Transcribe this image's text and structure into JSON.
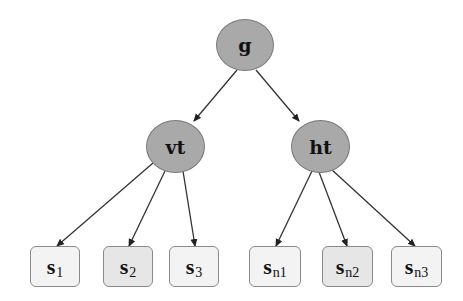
{
  "diagram": {
    "type": "tree",
    "colors": {
      "internal_node_fill": "#a9a9a9",
      "leaf_fill": "#f3f3f3",
      "leaf_alt_fill": "#e6e6e6",
      "edge": "#333333"
    },
    "root": {
      "id": "g",
      "label": "g"
    },
    "internal": [
      {
        "id": "vt",
        "label": "vt",
        "parent": "g"
      },
      {
        "id": "ht",
        "label": "ht",
        "parent": "g"
      }
    ],
    "leaves": [
      {
        "id": "s1",
        "main": "s",
        "sub": "1",
        "parent": "vt"
      },
      {
        "id": "s2",
        "main": "s",
        "sub": "2",
        "parent": "vt"
      },
      {
        "id": "s3",
        "main": "s",
        "sub": "3",
        "parent": "vt"
      },
      {
        "id": "sn1",
        "main": "s",
        "sub": "n1",
        "parent": "ht"
      },
      {
        "id": "sn2",
        "main": "s",
        "sub": "n2",
        "parent": "ht"
      },
      {
        "id": "sn3",
        "main": "s",
        "sub": "n3",
        "parent": "ht"
      }
    ],
    "edges": [
      [
        "g",
        "vt"
      ],
      [
        "g",
        "ht"
      ],
      [
        "vt",
        "s1"
      ],
      [
        "vt",
        "s2"
      ],
      [
        "vt",
        "s3"
      ],
      [
        "ht",
        "sn1"
      ],
      [
        "ht",
        "sn2"
      ],
      [
        "ht",
        "sn3"
      ]
    ]
  }
}
